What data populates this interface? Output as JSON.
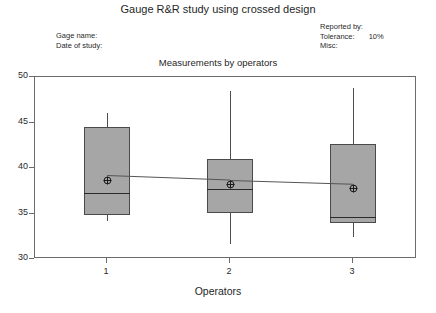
{
  "title": "Gauge R&R study using crossed design",
  "subtitle": "Measurements by operators",
  "header_left": [
    {
      "key": "Gage name:",
      "value": ""
    },
    {
      "key": "Date of study:",
      "value": ""
    }
  ],
  "header_right": [
    {
      "key": "Reported by:",
      "value": ""
    },
    {
      "key": "Tolerance:",
      "value": "10%"
    },
    {
      "key": "Misc:",
      "value": ""
    }
  ],
  "colors": {
    "box_fill": "#a6a6a6",
    "box_border": "#4a4a4a",
    "whisker": "#4d4d4d",
    "median": "#2b2b2b",
    "frame": "#6b6b6b",
    "mean_marker": "#1a1a1a",
    "connect": "#555555"
  },
  "chart_data": {
    "type": "box",
    "title": "Measurements by operators",
    "xlabel": "Operators",
    "ylabel": "",
    "categories": [
      "1",
      "2",
      "3"
    ],
    "ylim": [
      30,
      50
    ],
    "yticks": [
      30,
      35,
      40,
      45,
      50
    ],
    "xticks": [
      "1",
      "2",
      "3"
    ],
    "grid": false,
    "legend": null,
    "boxes": [
      {
        "category": "1",
        "whisker_low": 34.2,
        "q1": 34.8,
        "median": 37.3,
        "q3": 44.5,
        "whisker_high": 46.0,
        "mean": 39.2
      },
      {
        "category": "2",
        "whisker_low": 31.6,
        "q1": 35.1,
        "median": 37.7,
        "q3": 41.0,
        "whisker_high": 48.5,
        "mean": 38.7
      },
      {
        "category": "3",
        "whisker_low": 32.4,
        "q1": 34.0,
        "median": 34.6,
        "q3": 42.6,
        "whisker_high": 48.8,
        "mean": 38.3
      }
    ],
    "mean_series": {
      "name": "Operator means",
      "values": [
        39.2,
        38.7,
        38.3
      ],
      "connected": true
    }
  }
}
